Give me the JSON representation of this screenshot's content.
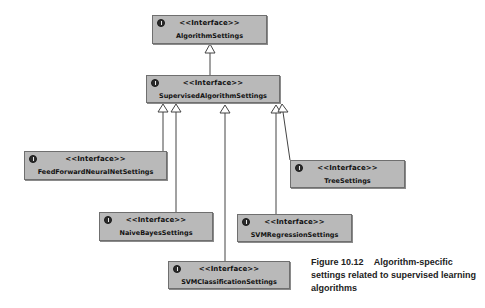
{
  "diagram": {
    "type": "uml-class-diagram",
    "stereotype_label": "<<Interface>>",
    "colors": {
      "box_fill": "#b9b9b9",
      "box_border": "#6f6f6f",
      "line": "#444444",
      "background": "#ffffff"
    },
    "nodes": [
      {
        "id": "algorithm-settings",
        "stereotype": "<<Interface>>",
        "name": "AlgorithmSettings",
        "icon": "interface-icon"
      },
      {
        "id": "supervised-algorithm-settings",
        "stereotype": "<<Interface>>",
        "name": "SupervisedAlgorithmSettings",
        "icon": "interface-icon"
      },
      {
        "id": "feed-forward-neural-net-settings",
        "stereotype": "<<Interface>>",
        "name": "FeedForwardNeuralNetSettings",
        "icon": "interface-icon"
      },
      {
        "id": "tree-settings",
        "stereotype": "<<Interface>>",
        "name": "TreeSettings",
        "icon": "interface-icon"
      },
      {
        "id": "naive-bayes-settings",
        "stereotype": "<<Interface>>",
        "name": "NaiveBayesSettings",
        "icon": "interface-icon"
      },
      {
        "id": "svm-regression-settings",
        "stereotype": "<<Interface>>",
        "name": "SVMRegressionSettings",
        "icon": "interface-icon"
      },
      {
        "id": "svm-classification-settings",
        "stereotype": "<<Interface>>",
        "name": "SVMClassificationSettings",
        "icon": "interface-icon"
      }
    ],
    "edges": [
      {
        "from": "SupervisedAlgorithmSettings",
        "to": "AlgorithmSettings",
        "kind": "generalization"
      },
      {
        "from": "FeedForwardNeuralNetSettings",
        "to": "SupervisedAlgorithmSettings",
        "kind": "generalization"
      },
      {
        "from": "NaiveBayesSettings",
        "to": "SupervisedAlgorithmSettings",
        "kind": "generalization"
      },
      {
        "from": "SVMClassificationSettings",
        "to": "SupervisedAlgorithmSettings",
        "kind": "generalization"
      },
      {
        "from": "SVMRegressionSettings",
        "to": "SupervisedAlgorithmSettings",
        "kind": "generalization"
      },
      {
        "from": "TreeSettings",
        "to": "SupervisedAlgorithmSettings",
        "kind": "generalization"
      }
    ]
  },
  "caption": {
    "figure_label": "Figure 10.12",
    "text": "Algorithm-specific settings related to supervised learning algorithms"
  }
}
